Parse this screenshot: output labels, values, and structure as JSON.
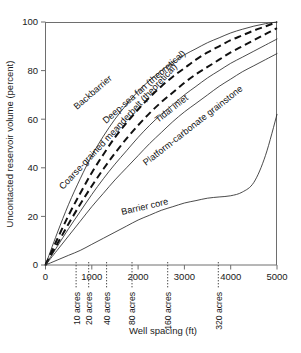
{
  "chart_data": {
    "type": "line",
    "title": "",
    "xlabel": "Well spacing (ft)",
    "ylabel": "Uncontacted reservoir volume (percent)",
    "xlim": [
      0,
      5000
    ],
    "ylim": [
      0,
      100
    ],
    "grid": false,
    "legend_position": "inline-labels",
    "x_ticks": [
      "0",
      "1000",
      "2000",
      "3000",
      "4000",
      "5000"
    ],
    "x_tick_values": [
      0,
      1000,
      2000,
      3000,
      4000,
      5000
    ],
    "y_ticks": [
      "0",
      "20",
      "40",
      "60",
      "80",
      "100"
    ],
    "y_tick_values": [
      0,
      20,
      40,
      60,
      80,
      100
    ],
    "secondary_axis": {
      "name": "acre-spacing-markers",
      "style": "dotted-vertical",
      "labels": [
        "10 acres",
        "20 acres",
        "40 acres",
        "80 acres",
        "160 acres",
        "320 acres"
      ],
      "values": [
        660,
        933,
        1320,
        1867,
        2640,
        3733
      ]
    },
    "x": [
      0,
      250,
      500,
      750,
      1000,
      1250,
      1500,
      1750,
      2000,
      2250,
      2500,
      2750,
      3000,
      3250,
      3500,
      3750,
      4000,
      4250,
      4500,
      4750,
      5000
    ],
    "series": [
      {
        "name": "Backbarrier",
        "label": "Backbarrier",
        "style": "solid",
        "values": [
          0,
          13,
          25,
          35.5,
          45,
          53,
          60,
          66,
          71.5,
          76,
          80,
          83.5,
          86.5,
          89,
          91.5,
          93.5,
          95.5,
          97,
          98.3,
          99.3,
          100
        ]
      },
      {
        "name": "Deep-sea fan (theoretical)",
        "label": "Deep-sea fan (theoretical)",
        "style": "dashed",
        "values": [
          0,
          10.5,
          20.5,
          29.5,
          38,
          45.5,
          52.5,
          58.5,
          64,
          69,
          73.5,
          77.5,
          81,
          84.5,
          87.5,
          90,
          92.5,
          94.5,
          96.5,
          98.2,
          100
        ]
      },
      {
        "name": "Coarse-grained meanderbelt (theoretical)",
        "label": "Coarse-grained meanderbelt (theoretical)",
        "style": "dashed",
        "values": [
          0,
          8.5,
          17,
          25,
          32.5,
          39.5,
          46,
          52,
          57.5,
          62.5,
          67,
          71,
          75,
          78.5,
          81.5,
          84.5,
          87.5,
          90,
          92.5,
          95,
          97.5
        ]
      },
      {
        "name": "Tidal inlet",
        "label": "Tidal inlet",
        "style": "solid",
        "values": [
          0,
          7.5,
          15,
          22,
          29,
          35.5,
          41.5,
          47,
          52.5,
          57.5,
          62,
          66,
          70,
          73.5,
          77,
          80,
          83,
          85.5,
          88,
          90.5,
          93
        ]
      },
      {
        "name": "Platform-carbonate grainstone",
        "label": "Platform-carbonate grainstone",
        "style": "solid",
        "values": [
          0,
          6,
          12,
          18,
          24,
          29.5,
          35,
          40,
          45,
          50,
          54.5,
          59,
          63,
          66.5,
          70,
          73.5,
          76.5,
          79.5,
          82,
          84.5,
          87
        ]
      },
      {
        "name": "Barrier core",
        "label": "Barrier core",
        "style": "solid",
        "values": [
          0,
          2,
          4,
          6,
          8.5,
          11,
          13.5,
          16,
          18.5,
          20.5,
          22.5,
          24,
          25.5,
          26.5,
          27.5,
          28,
          28.5,
          30,
          34,
          45,
          62
        ]
      }
    ]
  }
}
